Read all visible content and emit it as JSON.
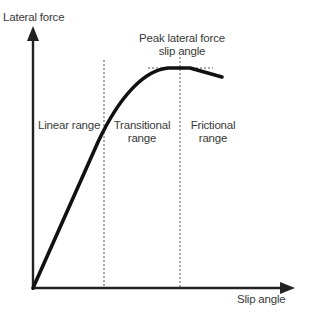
{
  "diagram": {
    "y_axis_label": "Lateral force",
    "x_axis_label": "Slip angle",
    "peak_label_line1": "Peak lateral force",
    "peak_label_line2": "slip angle",
    "regions": [
      {
        "line1": "Linear range",
        "line2": ""
      },
      {
        "line1": "Transitional",
        "line2": "range"
      },
      {
        "line1": "Frictional",
        "line2": "range"
      }
    ],
    "colors": {
      "curve": "#111111",
      "axes": "#222222",
      "dashed": "#555555",
      "text": "#3a3a3a",
      "background": "#ffffff"
    }
  }
}
